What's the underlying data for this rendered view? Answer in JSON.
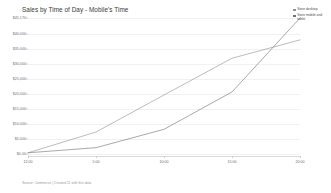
{
  "chart": {
    "title": "Sales by Time of Day - Mobile's Time",
    "footnote": "Source: Commerce | Created 11 with this data"
  },
  "legend": {
    "position": "top-right",
    "items": [
      {
        "label": "Store desktop",
        "color": "#8e8e93"
      },
      {
        "label": "Store mobile and tablet",
        "color": "#6f6f75"
      }
    ]
  },
  "chart_data": {
    "type": "line",
    "title": "Sales by Time of Day - Mobile's Time",
    "xlabel": "",
    "ylabel": "",
    "grid": true,
    "legend_position": "top-right",
    "x": [
      "12:00",
      "5:00",
      "10:00",
      "15:00",
      "20:00"
    ],
    "xtick_labels": [
      "12:00",
      "5:00",
      "10:00",
      "15:00",
      "20:00"
    ],
    "ytick_labels": [
      "$0.00",
      "$5,000",
      "$10,000",
      "$15,000",
      "$20,000",
      "$25,000",
      "$30,000",
      "$35,000",
      "$40,000",
      "$45,170"
    ],
    "ytick_values": [
      0,
      5000,
      10000,
      15000,
      20000,
      25000,
      30000,
      35000,
      40000,
      45170
    ],
    "ylim": [
      0,
      45170
    ],
    "series": [
      {
        "name": "Store desktop",
        "color": "#8e8e93",
        "x": [
          "12:00",
          "5:00",
          "10:00",
          "15:00",
          "20:00"
        ],
        "values": [
          400,
          7300,
          19600,
          31800,
          37900
        ]
      },
      {
        "name": "Store mobile and tablet",
        "color": "#6f6f75",
        "x": [
          "12:00",
          "5:00",
          "10:00",
          "15:00",
          "20:00"
        ],
        "values": [
          400,
          2100,
          8200,
          20600,
          45170
        ]
      }
    ]
  }
}
